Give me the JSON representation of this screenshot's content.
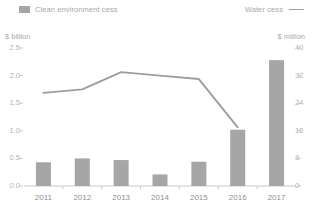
{
  "legend": {
    "bar_label": "Clean environment cess",
    "line_label": "Water cess",
    "bar_marker_icon": "bar-swatch-icon",
    "line_marker_icon": "line-swatch-icon"
  },
  "axes": {
    "left_unit": "$ billion",
    "right_unit": "$ million",
    "left_ticks": [
      "0.0",
      "0.5",
      "1.0",
      "1.5",
      "2.0",
      "2.5"
    ],
    "right_ticks": [
      "0",
      "8",
      "16",
      "24",
      "32",
      "40"
    ]
  },
  "colors": {
    "bar": "#a6a6a6",
    "line": "#9e9e9e",
    "axis": "#c9c9c9",
    "gridline": "#ededed",
    "text": "#9a9a9a",
    "tick_text": "#b4b4b4",
    "background": "#ffffff"
  },
  "chart_data": {
    "type": "bar",
    "title": "",
    "subtitle": "",
    "xlabel": "",
    "ylabel": "$ billion",
    "y2label": "$ million",
    "categories": [
      "2011",
      "2012",
      "2013",
      "2014",
      "2015",
      "2016",
      "2017"
    ],
    "ylim": [
      0,
      2.5
    ],
    "y2lim": [
      0,
      40
    ],
    "yticks": [
      0.0,
      0.5,
      1.0,
      1.5,
      2.0,
      2.5
    ],
    "y2ticks": [
      0,
      8,
      16,
      24,
      32,
      40
    ],
    "grid": false,
    "legend_position": "top",
    "series": [
      {
        "name": "Clean environment cess",
        "type": "bar",
        "axis": "left",
        "unit": "$ billion",
        "values": [
          0.43,
          0.5,
          0.47,
          0.21,
          0.44,
          1.02,
          2.28
        ]
      },
      {
        "name": "Water cess",
        "type": "line",
        "axis": "right",
        "unit": "$ million",
        "values": [
          27,
          28,
          33,
          32,
          31,
          17,
          null
        ]
      }
    ],
    "annotations": []
  }
}
